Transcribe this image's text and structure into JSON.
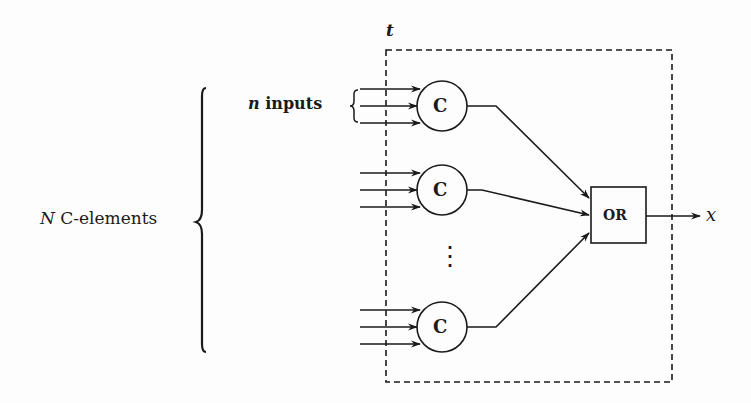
{
  "diagram": {
    "box_label": "t",
    "n_inputs_label_var": "n",
    "n_inputs_label_text": " inputs",
    "n_celements_label_var": "N",
    "n_celements_label_text": " C-elements",
    "celement_label": "C",
    "or_label": "OR",
    "output_label": "x",
    "ellipsis": "⋮",
    "celements": [
      {
        "id": "c1",
        "label": "C",
        "inputs": 3
      },
      {
        "id": "c2",
        "label": "C",
        "inputs": 3
      },
      {
        "id": "c3",
        "label": "C",
        "inputs": 3
      }
    ],
    "colors": {
      "stroke": "#1a1a1a",
      "background": "#fdfdfd"
    }
  }
}
